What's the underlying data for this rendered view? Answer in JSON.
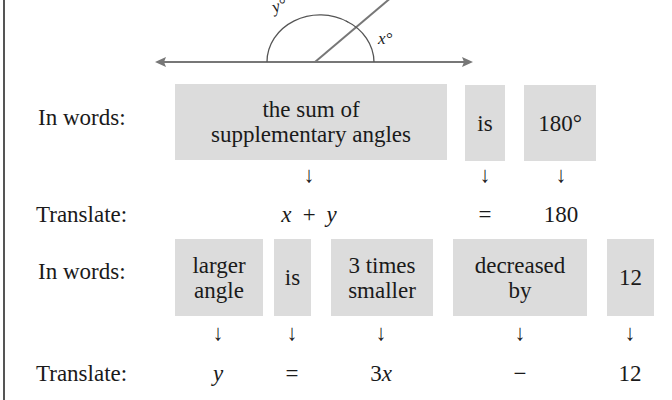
{
  "figure": {
    "diagram": {
      "angle_labels": {
        "x": "x°",
        "y": "y°"
      },
      "line_color": "#777777"
    },
    "block1": {
      "in_words_label": "In words:",
      "translate_label": "Translate:",
      "boxes": [
        {
          "line1": "the sum of",
          "line2": "supplementary angles",
          "translation": "x + y"
        },
        {
          "line1": "is",
          "line2": "",
          "translation": "="
        },
        {
          "line1": "180°",
          "line2": "",
          "translation": "180"
        }
      ]
    },
    "block2": {
      "in_words_label": "In words:",
      "translate_label": "Translate:",
      "boxes": [
        {
          "line1": "larger",
          "line2": "angle",
          "translation": "y"
        },
        {
          "line1": "is",
          "line2": "",
          "translation": "="
        },
        {
          "line1": "3 times",
          "line2": "smaller",
          "translation": "3x"
        },
        {
          "line1": "decreased",
          "line2": "by",
          "translation": "−"
        },
        {
          "line1": "12",
          "line2": "",
          "translation": "12"
        }
      ]
    },
    "arrow_glyph": "↓",
    "box_color": "#dcdcdc"
  }
}
